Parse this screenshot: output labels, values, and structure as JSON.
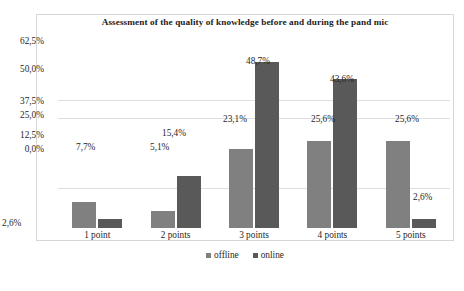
{
  "chart_data": {
    "type": "bar",
    "title": "Assessment of the quality of knowledge before and during the pand  mic",
    "xlabel": "",
    "ylabel": "",
    "categories": [
      "1 point",
      "2 points",
      "3 points",
      "4 points",
      "5 points"
    ],
    "series": [
      {
        "name": "offline",
        "color": "#808080",
        "values": [
          7.7,
          5.1,
          23.1,
          25.6,
          25.6
        ],
        "value_labels": [
          "7,7%",
          "5,1%",
          "23,1%",
          "25,6%",
          "25,6%"
        ]
      },
      {
        "name": "online",
        "color": "#595959",
        "values": [
          2.6,
          15.4,
          48.7,
          43.6,
          2.6
        ],
        "value_labels": [
          "2,6%",
          "15,4%",
          "48,7%",
          "43,6%",
          "2,6%"
        ]
      }
    ],
    "ytick_labels": [
      "62,5%",
      "50,0%",
      "37,5%",
      "25,0%",
      "12,5%",
      "0,0%"
    ],
    "ylim": [
      0,
      62.5
    ],
    "grid": true,
    "legend_position": "bottom"
  },
  "legend": {
    "items": [
      {
        "label": "offline",
        "color": "#808080"
      },
      {
        "label": "online",
        "color": "#595959"
      }
    ]
  }
}
